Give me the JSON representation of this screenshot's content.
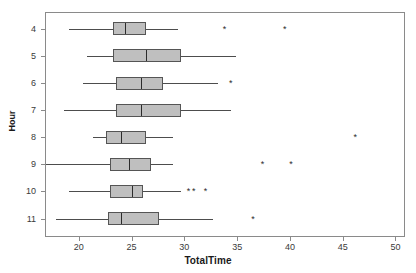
{
  "chart_data": {
    "type": "box",
    "title": "",
    "xlabel": "TotalTime",
    "ylabel": "Hour",
    "orientation": "horizontal",
    "xlim": [
      16.8,
      50.9
    ],
    "xticks": [
      20,
      25,
      30,
      35,
      40,
      45,
      50
    ],
    "xticklabels": [
      "20",
      "25",
      "30",
      "35",
      "40",
      "45",
      "50"
    ],
    "categories": [
      "4",
      "5",
      "6",
      "7",
      "8",
      "9",
      "10",
      "11"
    ],
    "grid": false,
    "legend": null,
    "box_fill": "#bfbfbf",
    "box_edge": "#555555",
    "outlier_marker": "*",
    "boxes": [
      {
        "category": "4",
        "whisker_low": 19.1,
        "q1": 23.2,
        "median": 24.4,
        "q3": 26.4,
        "whisker_high": 29.4,
        "outliers": [
          33.8,
          39.5
        ]
      },
      {
        "category": "5",
        "whisker_low": 20.8,
        "q1": 23.2,
        "median": 26.4,
        "q3": 29.7,
        "whisker_high": 34.9,
        "outliers": []
      },
      {
        "category": "6",
        "whisker_low": 20.4,
        "q1": 23.5,
        "median": 25.9,
        "q3": 28.0,
        "whisker_high": 33.2,
        "outliers": [
          34.4
        ]
      },
      {
        "category": "7",
        "whisker_low": 18.6,
        "q1": 23.5,
        "median": 25.9,
        "q3": 29.7,
        "whisker_high": 34.4,
        "outliers": []
      },
      {
        "category": "8",
        "whisker_low": 21.3,
        "q1": 22.6,
        "median": 24.0,
        "q3": 26.4,
        "whisker_high": 28.9,
        "outliers": [
          46.2
        ]
      },
      {
        "category": "9",
        "whisker_low": 16.9,
        "q1": 23.0,
        "median": 24.8,
        "q3": 26.8,
        "whisker_high": 28.9,
        "outliers": [
          37.4,
          40.1
        ]
      },
      {
        "category": "10",
        "whisker_low": 19.1,
        "q1": 23.0,
        "median": 25.0,
        "q3": 26.1,
        "whisker_high": 29.7,
        "outliers": [
          30.4,
          30.9,
          32.0
        ]
      },
      {
        "category": "11",
        "whisker_low": 17.8,
        "q1": 22.8,
        "median": 24.0,
        "q3": 27.6,
        "whisker_high": 32.7,
        "outliers": [
          36.5
        ]
      }
    ]
  }
}
